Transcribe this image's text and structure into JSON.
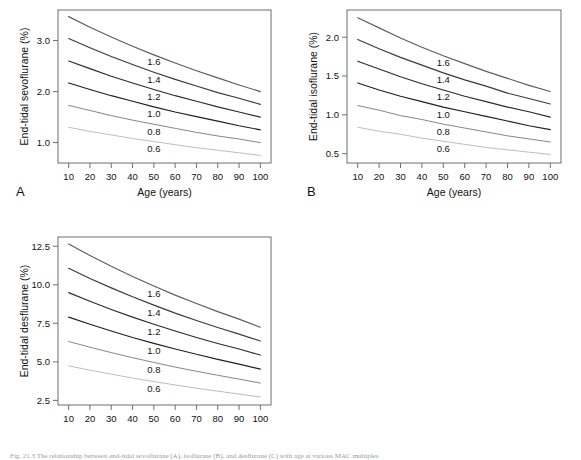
{
  "figure": {
    "caption_partial": "Fig. 21.3 The relationship between end-tidal sevoflurane (A), isoflurane (B), and desflurane (C) with age at various MAC multiples",
    "background": "#ffffff",
    "frame_color": "#6e6e6e"
  },
  "common": {
    "xlabel": "Age (years)",
    "xticks": [
      10,
      20,
      30,
      40,
      50,
      60,
      70,
      80,
      90,
      100
    ],
    "xlim": [
      5,
      105
    ],
    "curve_labels": [
      "1.6",
      "1.4",
      "1.2",
      "1.0",
      "0.8",
      "0.6"
    ],
    "series_colors": [
      "#5d5d5d",
      "#3a3a3a",
      "#2b2b2b",
      "#1f1f1f",
      "#808080",
      "#b9b9b9"
    ]
  },
  "panels": [
    {
      "letter": "A",
      "ylabel": "End-tidal sevoflurane (%)",
      "yticks": [
        1.0,
        2.0,
        3.0
      ],
      "ytick_labels": [
        "1.0",
        "2.0",
        "3.0"
      ],
      "ylim": [
        0.6,
        3.6
      ]
    },
    {
      "letter": "B",
      "ylabel": "End-tidal isoflurane (%)",
      "yticks": [
        0.5,
        1.0,
        1.5,
        2.0
      ],
      "ytick_labels": [
        "0.5",
        "1.0",
        "1.5",
        "2.0"
      ],
      "ylim": [
        0.38,
        2.35
      ]
    },
    {
      "letter": "C",
      "ylabel": "End-tidal desflurane (%)",
      "yticks": [
        2.5,
        5.0,
        7.5,
        10.0,
        12.5
      ],
      "ytick_labels": [
        "2.5",
        "5.0",
        "7.5",
        "10.0",
        "12.5"
      ],
      "ylim": [
        2.2,
        13.1
      ]
    }
  ],
  "chart_data": [
    {
      "type": "line",
      "panel": "A",
      "title": "End-tidal sevoflurane vs age",
      "xlabel": "Age (years)",
      "ylabel": "End-tidal sevoflurane (%)",
      "xlim": [
        5,
        105
      ],
      "ylim": [
        0.6,
        3.6
      ],
      "grid": false,
      "legend": "inline-curve-labels",
      "x": [
        10,
        20,
        30,
        40,
        50,
        60,
        70,
        80,
        90,
        100
      ],
      "series": [
        {
          "name": "1.6",
          "values": [
            3.47,
            3.26,
            3.07,
            2.89,
            2.72,
            2.56,
            2.41,
            2.27,
            2.13,
            2.0
          ]
        },
        {
          "name": "1.4",
          "values": [
            3.04,
            2.86,
            2.69,
            2.53,
            2.38,
            2.24,
            2.11,
            1.98,
            1.87,
            1.75
          ]
        },
        {
          "name": "1.2",
          "values": [
            2.6,
            2.45,
            2.3,
            2.17,
            2.04,
            1.92,
            1.81,
            1.7,
            1.6,
            1.5
          ]
        },
        {
          "name": "1.0",
          "values": [
            2.17,
            2.04,
            1.92,
            1.81,
            1.7,
            1.6,
            1.51,
            1.42,
            1.33,
            1.25
          ]
        },
        {
          "name": "0.8",
          "values": [
            1.73,
            1.63,
            1.53,
            1.44,
            1.36,
            1.28,
            1.2,
            1.13,
            1.07,
            1.0
          ]
        },
        {
          "name": "0.6",
          "values": [
            1.3,
            1.22,
            1.15,
            1.08,
            1.02,
            0.96,
            0.9,
            0.85,
            0.8,
            0.75
          ]
        }
      ]
    },
    {
      "type": "line",
      "panel": "B",
      "title": "End-tidal isoflurane vs age",
      "xlabel": "Age (years)",
      "ylabel": "End-tidal isoflurane (%)",
      "xlim": [
        5,
        105
      ],
      "ylim": [
        0.38,
        2.35
      ],
      "grid": false,
      "legend": "inline-curve-labels",
      "x": [
        10,
        20,
        30,
        40,
        50,
        60,
        70,
        80,
        90,
        100
      ],
      "series": [
        {
          "name": "1.6",
          "values": [
            2.25,
            2.12,
            1.99,
            1.87,
            1.76,
            1.66,
            1.56,
            1.47,
            1.38,
            1.3
          ]
        },
        {
          "name": "1.4",
          "values": [
            1.97,
            1.85,
            1.74,
            1.64,
            1.54,
            1.45,
            1.37,
            1.28,
            1.21,
            1.14
          ]
        },
        {
          "name": "1.2",
          "values": [
            1.69,
            1.59,
            1.49,
            1.4,
            1.32,
            1.24,
            1.17,
            1.1,
            1.04,
            0.97
          ]
        },
        {
          "name": "1.0",
          "values": [
            1.41,
            1.32,
            1.24,
            1.17,
            1.1,
            1.04,
            0.98,
            0.92,
            0.86,
            0.81
          ]
        },
        {
          "name": "0.8",
          "values": [
            1.12,
            1.06,
            0.99,
            0.94,
            0.88,
            0.83,
            0.78,
            0.73,
            0.69,
            0.65
          ]
        },
        {
          "name": "0.6",
          "values": [
            0.84,
            0.79,
            0.75,
            0.7,
            0.66,
            0.62,
            0.58,
            0.55,
            0.52,
            0.49
          ]
        }
      ]
    },
    {
      "type": "line",
      "panel": "C",
      "title": "End-tidal desflurane vs age",
      "xlabel": "Age (years)",
      "ylabel": "End-tidal desflurane (%)",
      "xlim": [
        5,
        105
      ],
      "ylim": [
        2.2,
        13.1
      ],
      "grid": false,
      "legend": "inline-curve-labels",
      "x": [
        10,
        20,
        30,
        40,
        50,
        60,
        70,
        80,
        90,
        100
      ],
      "series": [
        {
          "name": "1.6",
          "values": [
            12.65,
            11.9,
            11.2,
            10.54,
            9.92,
            9.33,
            8.78,
            8.26,
            7.77,
            7.25
          ]
        },
        {
          "name": "1.4",
          "values": [
            11.07,
            10.41,
            9.8,
            9.22,
            8.68,
            8.16,
            7.68,
            7.23,
            6.8,
            6.35
          ]
        },
        {
          "name": "1.2",
          "values": [
            9.49,
            8.93,
            8.4,
            7.9,
            7.44,
            7.0,
            6.58,
            6.19,
            5.83,
            5.44
          ]
        },
        {
          "name": "1.0",
          "values": [
            7.9,
            7.44,
            7.0,
            6.58,
            6.2,
            5.83,
            5.49,
            5.16,
            4.85,
            4.53
          ]
        },
        {
          "name": "0.8",
          "values": [
            6.32,
            5.95,
            5.6,
            5.27,
            4.96,
            4.66,
            4.39,
            4.13,
            3.88,
            3.62
          ]
        },
        {
          "name": "0.6",
          "values": [
            4.74,
            4.46,
            4.2,
            3.95,
            3.72,
            3.5,
            3.29,
            3.1,
            2.91,
            2.72
          ]
        }
      ]
    }
  ]
}
